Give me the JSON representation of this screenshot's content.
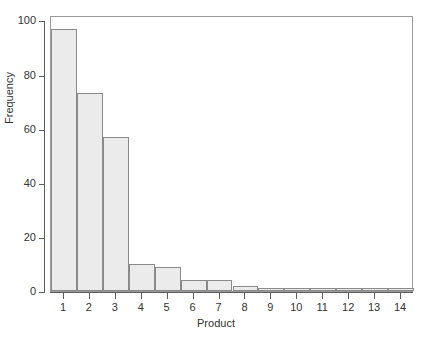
{
  "chart_data": {
    "type": "bar",
    "title": "",
    "subtitle": "",
    "xlabel": "Product",
    "ylabel": "Frequency",
    "categories": [
      "1",
      "2",
      "3",
      "4",
      "5",
      "6",
      "7",
      "8",
      "9",
      "10",
      "11",
      "12",
      "13",
      "14"
    ],
    "values": [
      97,
      73,
      57,
      10,
      9,
      4,
      4,
      2,
      1,
      1,
      1,
      1,
      1,
      1
    ],
    "series": [
      {
        "name": "Frequency",
        "values": [
          97,
          73,
          57,
          10,
          9,
          4,
          4,
          2,
          1,
          1,
          1,
          1,
          1,
          1
        ]
      }
    ],
    "ylim": [
      0,
      102
    ],
    "xlim": [
      0.5,
      14.5
    ],
    "y_ticks": [
      0,
      20,
      40,
      60,
      80,
      100
    ],
    "y_tick_labels": [
      "0",
      "20",
      "40",
      "60",
      "80",
      "100"
    ],
    "x_ticks": [
      1,
      2,
      3,
      4,
      5,
      6,
      7,
      8,
      9,
      10,
      11,
      12,
      13,
      14
    ],
    "x_tick_labels": [
      "1",
      "2",
      "3",
      "4",
      "5",
      "6",
      "7",
      "8",
      "9",
      "10",
      "11",
      "12",
      "13",
      "14"
    ],
    "grid": false,
    "legend": false,
    "legend_position": "none",
    "bar_style": "adjacent",
    "annotations": [],
    "colors": {
      "bar_fill": "#ebebeb",
      "bar_stroke": "#8a8a8a",
      "frame": "#9a9a9a",
      "axis": "#5d5d5d",
      "text": "#333333",
      "background": "#ffffff"
    }
  },
  "figure": {
    "width": 432,
    "height": 344,
    "plot_left": 50,
    "plot_top": 16,
    "plot_width": 363,
    "plot_height": 276
  }
}
